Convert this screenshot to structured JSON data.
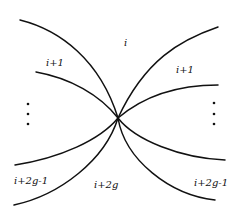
{
  "diagram": {
    "center": {
      "x": 118,
      "y": 118
    },
    "curves": [
      {
        "id": "upper-left-top",
        "d": "M20,20 C60,30 100,60 118,118"
      },
      {
        "id": "upper-left-bottom",
        "d": "M36,72 C70,78 100,95 118,118"
      },
      {
        "id": "upper-right-top",
        "d": "M218,27 C180,40 145,60 118,118"
      },
      {
        "id": "upper-right-bottom",
        "d": "M218,85 C180,85 145,95 118,118"
      },
      {
        "id": "lower-left-top",
        "d": "M15,165 C60,158 100,140 118,118"
      },
      {
        "id": "lower-left-bottom",
        "d": "M14,205 C60,195 105,160 118,118"
      },
      {
        "id": "lower-right-top",
        "d": "M225,160 C180,158 135,140 118,118"
      },
      {
        "id": "lower-right-bottom",
        "d": "M215,200 C170,195 125,160 118,118"
      }
    ],
    "labels": [
      {
        "text": "i",
        "x": 124,
        "y": 46
      },
      {
        "text": "i+1",
        "x": 46,
        "y": 66
      },
      {
        "text": "i+1",
        "x": 176,
        "y": 73
      },
      {
        "text": "i+2g-1",
        "x": 14,
        "y": 184
      },
      {
        "text": "i+2g",
        "x": 94,
        "y": 188
      },
      {
        "text": "i+2g-1",
        "x": 194,
        "y": 186
      }
    ],
    "dots": [
      {
        "x": 28,
        "y": 104
      },
      {
        "x": 28,
        "y": 114
      },
      {
        "x": 28,
        "y": 124
      },
      {
        "x": 214,
        "y": 103
      },
      {
        "x": 214,
        "y": 114
      },
      {
        "x": 214,
        "y": 124
      }
    ]
  }
}
